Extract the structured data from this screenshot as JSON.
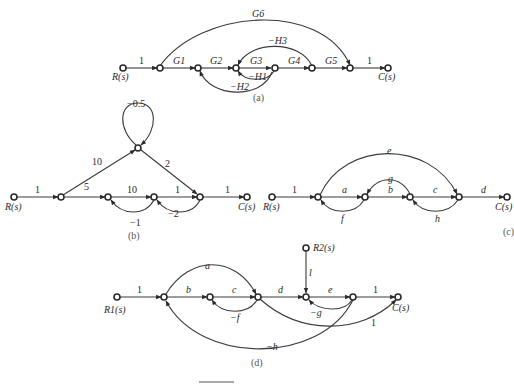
{
  "graphs": {
    "a": {
      "caption": "(a)",
      "input": "R(s)",
      "output": "C(s)",
      "edges": {
        "in": "1",
        "g1": "G1",
        "g2": "G2",
        "g3": "G3",
        "g4": "G4",
        "g5": "G5",
        "out": "1",
        "g6": "G6",
        "h1": "−H1",
        "h2": "−H2",
        "h3": "−H3"
      }
    },
    "b": {
      "caption": "(b)",
      "input": "R(s)",
      "output": "C(s)",
      "edges": {
        "in": "1",
        "up": "10",
        "self": "−0.5",
        "down": "2",
        "e5": "5",
        "e10": "10",
        "e1": "1",
        "out": "1",
        "fb1": "−1",
        "fb2": "−2"
      }
    },
    "c": {
      "caption": "(c)",
      "input": "R(s)",
      "output": "C(s)",
      "edges": {
        "in": "1",
        "a": "a",
        "b": "b",
        "c": "c",
        "d": "d",
        "e": "e",
        "f": "f",
        "g": "g",
        "h": "h"
      }
    },
    "d": {
      "caption": "(d)",
      "input1": "R1(s)",
      "input2": "R2(s)",
      "output": "C(s)",
      "edges": {
        "in": "1",
        "a": "a",
        "b": "b",
        "c": "c",
        "d": "d",
        "e": "e",
        "out": "1",
        "f": "−f",
        "g": "−g",
        "h": "−h",
        "l": "l",
        "skip": "1"
      }
    }
  }
}
